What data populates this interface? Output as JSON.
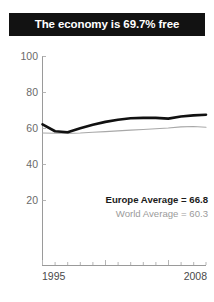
{
  "title": {
    "text": "The economy is 69.7% free"
  },
  "legend": {
    "europe": "Europe Average = 66.8",
    "world": "World Average = 60.3"
  },
  "colors": {
    "banner_background": "#121212",
    "banner_text": "#ffffff",
    "europe_line": "#111111",
    "world_line": "#a8a8a8",
    "axis": "#9a9a9a",
    "tick_label": "#6a6a6a"
  },
  "chart_data": {
    "type": "line",
    "title": "The economy is 69.7% free",
    "xlabel": "",
    "ylabel": "",
    "xlim": [
      1995,
      2008
    ],
    "ylim": [
      0,
      100
    ],
    "yticks": [
      100,
      80,
      60,
      40,
      20
    ],
    "ytick_labels": [
      "100",
      "80",
      "60",
      "40",
      "20"
    ],
    "xticks": [
      1995,
      1996,
      1997,
      1998,
      1999,
      2000,
      2001,
      2002,
      2003,
      2004,
      2005,
      2006,
      2007,
      2008
    ],
    "xtick_labels_shown": [
      "1995",
      "2008"
    ],
    "grid": false,
    "legend_position": "inside-bottom-right",
    "x": [
      1995,
      1996,
      1997,
      1998,
      1999,
      2000,
      2001,
      2002,
      2003,
      2004,
      2005,
      2006,
      2007,
      2008
    ],
    "series": [
      {
        "name": "Europe Average = 66.8",
        "color": "#111111",
        "linewidth": 2.6,
        "average": 66.8,
        "values": [
          62.0,
          58.2,
          57.6,
          59.8,
          61.8,
          63.4,
          64.6,
          65.4,
          65.6,
          65.6,
          65.2,
          66.4,
          67.0,
          67.4
        ]
      },
      {
        "name": "World Average = 60.3",
        "color": "#a8a8a8",
        "linewidth": 1.1,
        "average": 60.3,
        "values": [
          57.2,
          57.1,
          57.0,
          57.2,
          57.6,
          58.0,
          58.4,
          58.8,
          59.2,
          59.6,
          60.0,
          60.6,
          60.8,
          60.4
        ]
      }
    ],
    "annotations": [
      {
        "text": "Europe Average = 66.8",
        "style": "bold-dark"
      },
      {
        "text": "World Average = 60.3",
        "style": "light-gray"
      }
    ]
  }
}
